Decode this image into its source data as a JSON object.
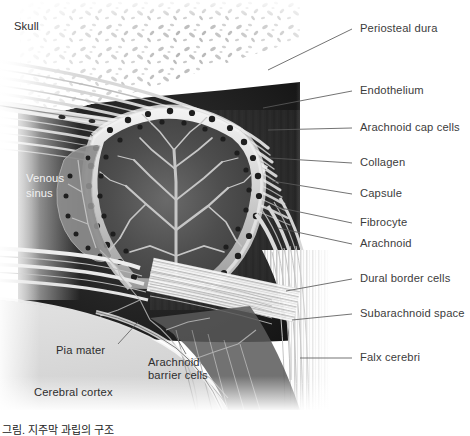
{
  "figure": {
    "background_color": "#ffffff",
    "ink_color": "#3c3c3c",
    "leader_color": "#5a5a5a"
  },
  "labels_left": [
    {
      "id": "skull",
      "text": "Skull",
      "x": 14,
      "y": 26,
      "style": "dark"
    },
    {
      "id": "venous-sinus-line1",
      "text": "Venous",
      "x": 26,
      "y": 178,
      "style": "light"
    },
    {
      "id": "venous-sinus-line2",
      "text": "sinus",
      "x": 26,
      "y": 192,
      "style": "light"
    },
    {
      "id": "pia-mater",
      "text": "Pia mater",
      "x": 56,
      "y": 350,
      "style": "dark"
    },
    {
      "id": "arachnoid-barrier-cells-line1",
      "text": "Arachnoid",
      "x": 148,
      "y": 362,
      "style": "dark"
    },
    {
      "id": "arachnoid-barrier-cells-line2",
      "text": "barrier cells",
      "x": 148,
      "y": 375,
      "style": "dark"
    },
    {
      "id": "cerebral-cortex",
      "text": "Cerebral cortex",
      "x": 34,
      "y": 392,
      "style": "dark"
    }
  ],
  "labels_right": [
    {
      "id": "periosteal-dura",
      "text": "Periosteal dura",
      "x": 360,
      "y": 22,
      "leader": {
        "x1": 352,
        "y1": 29,
        "x2": 268,
        "y2": 70
      }
    },
    {
      "id": "endothelium",
      "text": "Endothelium",
      "x": 360,
      "y": 85,
      "leader": {
        "x1": 352,
        "y1": 91,
        "x2": 263,
        "y2": 108
      }
    },
    {
      "id": "arachnoid-cap-cells",
      "text": "Arachnoid cap cells",
      "x": 360,
      "y": 122,
      "leader": {
        "x1": 352,
        "y1": 128,
        "x2": 268,
        "y2": 130
      }
    },
    {
      "id": "collagen",
      "text": "Collagen",
      "x": 360,
      "y": 158,
      "leader": {
        "x1": 352,
        "y1": 163,
        "x2": 270,
        "y2": 158
      }
    },
    {
      "id": "capsule",
      "text": "Capsule",
      "x": 360,
      "y": 188,
      "leader": {
        "x1": 352,
        "y1": 194,
        "x2": 272,
        "y2": 181
      }
    },
    {
      "id": "fibrocyte",
      "text": "Fibrocyte",
      "x": 360,
      "y": 217,
      "leader": {
        "x1": 352,
        "y1": 223,
        "x2": 276,
        "y2": 207
      }
    },
    {
      "id": "arachnoid",
      "text": "Arachnoid",
      "x": 360,
      "y": 238,
      "leader": {
        "x1": 352,
        "y1": 244,
        "x2": 278,
        "y2": 228
      }
    },
    {
      "id": "dural-border-cells",
      "text": "Dural border cells",
      "x": 360,
      "y": 273,
      "leader": {
        "x1": 352,
        "y1": 279,
        "x2": 286,
        "y2": 291
      }
    },
    {
      "id": "subarachnoid-space",
      "text": "Subarachnoid space",
      "x": 360,
      "y": 308,
      "leader": {
        "x1": 352,
        "y1": 314,
        "x2": 292,
        "y2": 320
      }
    },
    {
      "id": "falx-cerebri",
      "text": "Falx cerebri",
      "x": 360,
      "y": 352,
      "leader": {
        "x1": 352,
        "y1": 358,
        "x2": 300,
        "y2": 358
      }
    }
  ],
  "caption": {
    "text": "그림. 지주막 과립의 구조"
  }
}
